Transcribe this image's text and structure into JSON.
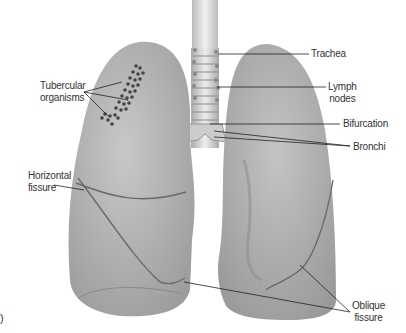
{
  "figure": {
    "panel_marker": ")"
  },
  "labels": {
    "tubercular": {
      "line1": "Tubercular",
      "line2": "organisms"
    },
    "trachea": "Trachea",
    "lymph": {
      "line1": "Lymph",
      "line2": "nodes"
    },
    "bifurcation": "Bifurcation",
    "bronchi": "Bronchi",
    "horizontal": {
      "line1": "Horizontal",
      "line2": "fissure"
    },
    "oblique": {
      "line1": "Oblique",
      "line2": "fissure"
    }
  },
  "colors": {
    "lung_fill": "#b9b9b9",
    "lung_shade": "#9a9a9a",
    "trachea": "#dcdcdc",
    "organisms": "#444444",
    "leader_line": "#222222",
    "label_text": "#333333"
  }
}
